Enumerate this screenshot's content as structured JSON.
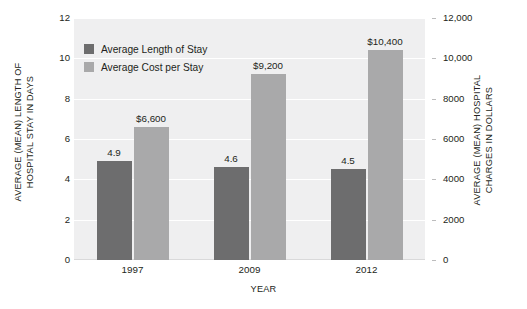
{
  "chart_data": {
    "type": "bar",
    "title": "",
    "subtitle": "",
    "xlabel": "YEAR",
    "categories": [
      "1997",
      "2009",
      "2012"
    ],
    "series": [
      {
        "name": "Average Length of Stay",
        "axis": "left",
        "color": "#6d6d6e",
        "values": [
          4.9,
          4.6,
          4.5
        ],
        "value_labels": [
          "4.9",
          "4.6",
          "4.5"
        ]
      },
      {
        "name": "Average Cost per Stay",
        "axis": "right",
        "color": "#a9a9aa",
        "values": [
          6600,
          9200,
          10400
        ],
        "value_labels": [
          "$6,600",
          "$9,200",
          "$10,400"
        ]
      }
    ],
    "left_axis": {
      "label": "AVERAGE (MEAN) LENGTH OF\nHOSPITAL STAY IN DAYS",
      "ylim": [
        0,
        12
      ],
      "ticks": [
        0,
        2,
        4,
        6,
        8,
        10,
        12
      ],
      "tick_labels": [
        "0",
        "2",
        "4",
        "6",
        "8",
        "10",
        "12"
      ]
    },
    "right_axis": {
      "label": "AVERAGE (MEAN) HOSPITAL\nCHARGES IN DOLLARS",
      "ylim": [
        0,
        12000
      ],
      "ticks": [
        0,
        2000,
        4000,
        6000,
        8000,
        10000,
        12000
      ],
      "tick_labels": [
        "0",
        "2000",
        "4000",
        "6000",
        "8000",
        "10,000",
        "12,000"
      ]
    },
    "grid": true,
    "legend_position": "top-left",
    "plot_background": "#efeff0"
  },
  "legend": {
    "items": [
      {
        "label": "Average Length of Stay",
        "color": "#6d6d6e"
      },
      {
        "label": "Average Cost per Stay",
        "color": "#a9a9aa"
      }
    ]
  }
}
